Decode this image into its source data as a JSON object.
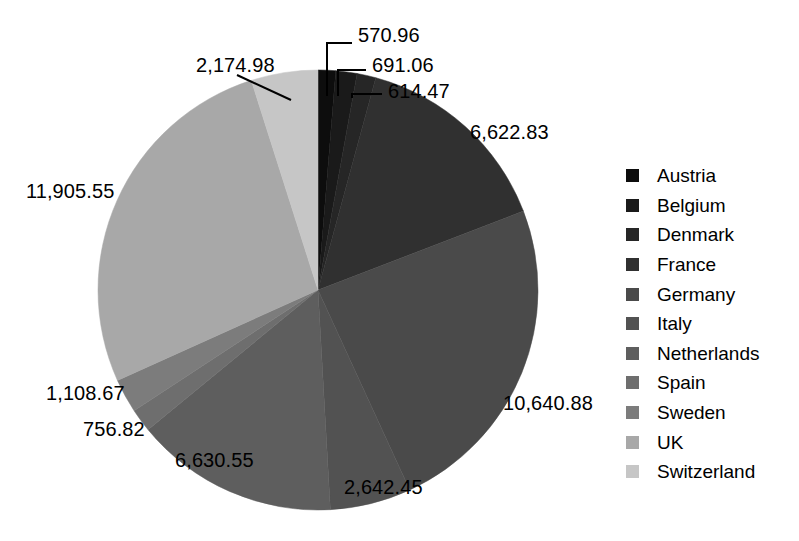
{
  "chart_data": {
    "type": "pie",
    "title": "",
    "subtitle": "",
    "xlabel": "",
    "ylabel": "",
    "grid": false,
    "legend_position": "right",
    "start_angle_deg": 0,
    "direction": "clockwise",
    "total": 44359.22,
    "categories": [
      "Austria",
      "Belgium",
      "Denmark",
      "France",
      "Germany",
      "Italy",
      "Netherlands",
      "Spain",
      "Sweden",
      "UK",
      "Switzerland"
    ],
    "values": [
      570.96,
      691.06,
      614.47,
      6622.83,
      10640.88,
      2642.45,
      6630.55,
      756.82,
      1108.67,
      11905.55,
      2174.98
    ],
    "value_labels": [
      "570.96",
      "691.06",
      "614.47",
      "6,622.83",
      "10,640.88",
      "2,642.45",
      "6,630.55",
      "756.82",
      "1,108.67",
      "11,905.55",
      "2,174.98"
    ],
    "colors": [
      "#0d0d0d",
      "#1a1a1a",
      "#262626",
      "#303030",
      "#4a4a4a",
      "#525252",
      "#5e5e5e",
      "#6e6e6e",
      "#7c7c7c",
      "#a8a8a8",
      "#c6c6c6"
    ],
    "slices": [
      {
        "name": "Austria",
        "value": 570.96,
        "label": "570.96",
        "color": "#0d0d0d"
      },
      {
        "name": "Belgium",
        "value": 691.06,
        "label": "691.06",
        "color": "#1a1a1a"
      },
      {
        "name": "Denmark",
        "value": 614.47,
        "label": "614.47",
        "color": "#262626"
      },
      {
        "name": "France",
        "value": 6622.83,
        "label": "6,622.83",
        "color": "#303030"
      },
      {
        "name": "Germany",
        "value": 10640.88,
        "label": "10,640.88",
        "color": "#4a4a4a"
      },
      {
        "name": "Italy",
        "value": 2642.45,
        "label": "2,642.45",
        "color": "#525252"
      },
      {
        "name": "Netherlands",
        "value": 6630.55,
        "label": "6,630.55",
        "color": "#5e5e5e"
      },
      {
        "name": "Spain",
        "value": 756.82,
        "label": "756.82",
        "color": "#6e6e6e"
      },
      {
        "name": "Sweden",
        "value": 1108.67,
        "label": "1,108.67",
        "color": "#7c7c7c"
      },
      {
        "name": "UK",
        "value": 11905.55,
        "label": "11,905.55",
        "color": "#a8a8a8"
      },
      {
        "name": "Switzerland",
        "value": 2174.98,
        "label": "2,174.98",
        "color": "#c6c6c6"
      }
    ]
  },
  "legend": {
    "items": [
      {
        "label": "Austria",
        "color": "#0d0d0d"
      },
      {
        "label": "Belgium",
        "color": "#1a1a1a"
      },
      {
        "label": "Denmark",
        "color": "#262626"
      },
      {
        "label": "France",
        "color": "#303030"
      },
      {
        "label": "Germany",
        "color": "#4a4a4a"
      },
      {
        "label": "Italy",
        "color": "#525252"
      },
      {
        "label": "Netherlands",
        "color": "#5e5e5e"
      },
      {
        "label": "Spain",
        "color": "#6e6e6e"
      },
      {
        "label": "Sweden",
        "color": "#7c7c7c"
      },
      {
        "label": "UK",
        "color": "#a8a8a8"
      },
      {
        "label": "Switzerland",
        "color": "#c6c6c6"
      }
    ]
  },
  "labels": {
    "austria": {
      "text": "570.96",
      "x": 358,
      "y": 24
    },
    "belgium": {
      "text": "691.06",
      "x": 372,
      "y": 54
    },
    "denmark": {
      "text": "614.47",
      "x": 388,
      "y": 80
    },
    "france": {
      "text": "6,622.83",
      "x": 470,
      "y": 121
    },
    "germany": {
      "text": "10,640.88",
      "x": 503,
      "y": 392
    },
    "italy": {
      "text": "2,642.45",
      "x": 344,
      "y": 476
    },
    "netherlands": {
      "text": "6,630.55",
      "x": 175,
      "y": 449
    },
    "spain": {
      "text": "756.82",
      "x": 83,
      "y": 418
    },
    "sweden": {
      "text": "1,108.67",
      "x": 46,
      "y": 382
    },
    "uk": {
      "text": "11,905.55",
      "x": 26,
      "y": 180
    },
    "switzerland": {
      "text": "2,174.98",
      "x": 196,
      "y": 54
    }
  },
  "geometry": {
    "cx": 318,
    "cy": 290,
    "r": 220
  }
}
